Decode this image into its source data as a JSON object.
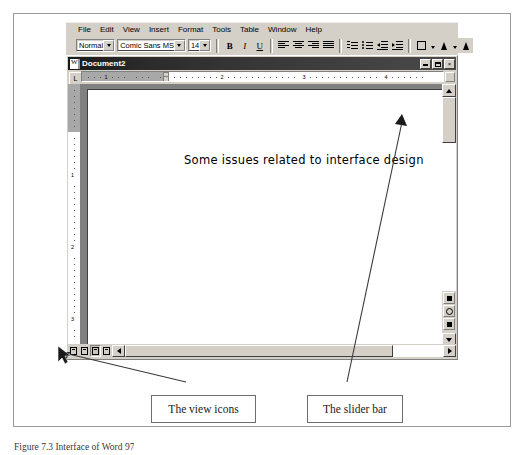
{
  "figure": {
    "caption": "Figure 7.3  Interface of Word 97"
  },
  "word": {
    "menu": {
      "items": [
        {
          "label": "File"
        },
        {
          "label": "Edit"
        },
        {
          "label": "View"
        },
        {
          "label": "Insert"
        },
        {
          "label": "Format"
        },
        {
          "label": "Tools"
        },
        {
          "label": "Table"
        },
        {
          "label": "Window"
        },
        {
          "label": "Help"
        }
      ]
    },
    "formatting_toolbar": {
      "style_value": "Normal",
      "style_placeholder": "Style",
      "font_value": "Comic Sans MS",
      "font_placeholder": "Font",
      "size_value": "14",
      "size_placeholder": "Size",
      "bold_label": "B",
      "italic_label": "I",
      "underline_label": "U",
      "buttons": [
        {
          "name": "align-left",
          "label": "Align Left"
        },
        {
          "name": "align-center",
          "label": "Center"
        },
        {
          "name": "align-right",
          "label": "Align Right"
        },
        {
          "name": "justify",
          "label": "Justify"
        },
        {
          "name": "numbering",
          "label": "Numbering"
        },
        {
          "name": "bullets",
          "label": "Bullets"
        },
        {
          "name": "decrease-indent",
          "label": "Decrease Indent"
        },
        {
          "name": "increase-indent",
          "label": "Increase Indent"
        },
        {
          "name": "borders",
          "label": "Borders"
        },
        {
          "name": "highlight",
          "label": "Highlight"
        }
      ]
    },
    "document_window": {
      "title": "Document2",
      "minimize_label": "",
      "maximize_label": "",
      "close_label": "×",
      "body_text": "Some issues related to interface design"
    },
    "hruler": {
      "tab_selector_glyph": "L",
      "numbers": [
        "1",
        "2",
        "3",
        "4"
      ],
      "unit": "inches"
    },
    "vruler": {
      "numbers": [
        "1",
        "2",
        "3"
      ]
    },
    "view_icons": [
      {
        "name": "normal-view",
        "label": "Normal View"
      },
      {
        "name": "online-layout-view",
        "label": "Online Layout View"
      },
      {
        "name": "page-layout-view",
        "label": "Page Layout View"
      },
      {
        "name": "outline-view",
        "label": "Outline View"
      }
    ],
    "scrollbars": {
      "vertical_up_label": "Scroll Up",
      "vertical_down_label": "Scroll Down",
      "previous_page_label": "Previous Page",
      "select_browse_object_label": "Select Browse Object",
      "next_page_label": "Next Page",
      "horizontal_left_label": "Scroll Left",
      "horizontal_right_label": "Scroll Right"
    }
  },
  "annotations": [
    {
      "id": "view-icons",
      "text": "The view icons"
    },
    {
      "id": "slider-bar",
      "text": "The slider bar"
    }
  ],
  "colors": {
    "chrome_face": "#d4d0c8",
    "titlebar": "#2b2b2b",
    "page": "#ffffff",
    "work_area": "#808080",
    "frame_border": "#9a9a9a"
  }
}
